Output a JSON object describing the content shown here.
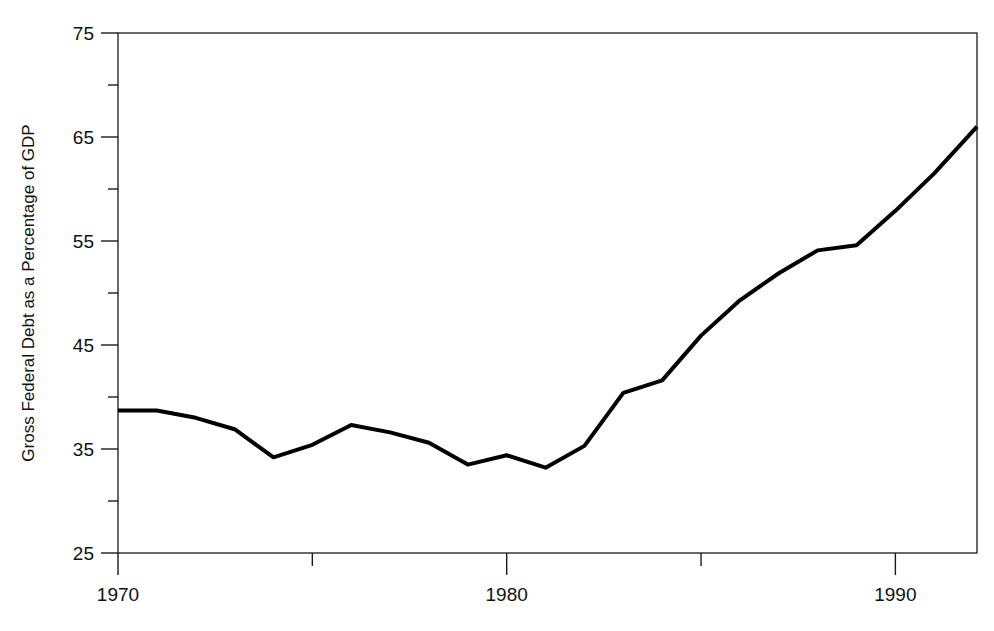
{
  "chart_data": {
    "type": "line",
    "title": "",
    "subtitle": "",
    "xlabel": "",
    "ylabel": "Gross Federal Debt as a Percentage of GDP",
    "xlim": [
      1970,
      1992.1
    ],
    "ylim": [
      25,
      75
    ],
    "grid": false,
    "legend": null,
    "x_major_ticks": [
      1970,
      1980,
      1990
    ],
    "x_major_tick_labels": [
      "1970",
      "1980",
      "1990"
    ],
    "x_minor_ticks": [
      1975,
      1985
    ],
    "y_major_ticks": [
      25,
      35,
      45,
      55,
      65,
      75
    ],
    "y_major_tick_labels": [
      "25",
      "35",
      "45",
      "55",
      "65",
      "75"
    ],
    "y_minor_ticks": [
      30,
      40,
      50,
      60,
      70
    ],
    "line_color": "#000000",
    "line_width": 4,
    "series": [
      {
        "name": "Gross Federal Debt as a Percentage of GDP",
        "x": [
          1970,
          1971,
          1972,
          1973,
          1974,
          1975,
          1976,
          1977,
          1978,
          1979,
          1980,
          1981,
          1982,
          1983,
          1984,
          1985,
          1986,
          1987,
          1988,
          1989,
          1990,
          1991,
          1992.1
        ],
        "values": [
          38.7,
          38.7,
          38.0,
          36.9,
          34.2,
          35.4,
          37.3,
          36.6,
          35.6,
          33.5,
          34.4,
          33.2,
          35.3,
          40.4,
          41.6,
          45.9,
          49.3,
          51.9,
          54.1,
          54.6,
          57.9,
          61.5,
          66.0
        ]
      }
    ]
  },
  "axes": {
    "ylabel": "Gross Federal Debt as a Percentage of GDP"
  }
}
